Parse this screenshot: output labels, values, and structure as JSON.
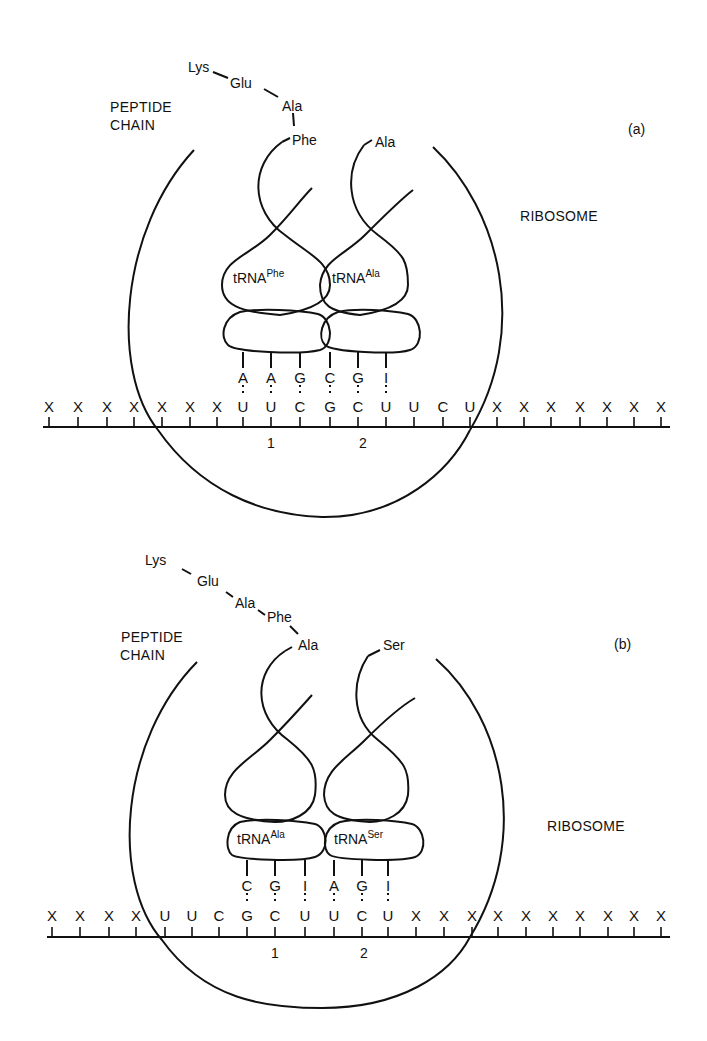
{
  "panels": [
    {
      "id": "a",
      "panel_label": "(a)",
      "peptide_label_line1": "PEPTIDE",
      "peptide_label_line2": "CHAIN",
      "ribosome_label": "RIBOSOME",
      "peptide_chain": [
        "Lys",
        "Glu",
        "Ala",
        "Phe"
      ],
      "trna_left": {
        "name": "tRNA",
        "sup": "Phe",
        "amino_acid": "Phe",
        "anticodon": [
          "A",
          "A",
          "G"
        ]
      },
      "trna_right": {
        "name": "tRNA",
        "sup": "Ala",
        "amino_acid": "Ala",
        "anticodon": [
          "C",
          "G",
          "I"
        ]
      },
      "mrna": [
        "X",
        "X",
        "X",
        "X",
        "X",
        "X",
        "X",
        "U",
        "U",
        "C",
        "G",
        "C",
        "U",
        "U",
        "C",
        "U",
        "X",
        "X",
        "X",
        "X",
        "X",
        "X",
        "X"
      ],
      "site_labels": [
        "1",
        "2"
      ]
    },
    {
      "id": "b",
      "panel_label": "(b)",
      "peptide_label_line1": "PEPTIDE",
      "peptide_label_line2": "CHAIN",
      "ribosome_label": "RIBOSOME",
      "peptide_chain": [
        "Lys",
        "Glu",
        "Ala",
        "Phe",
        "Ala"
      ],
      "trna_left": {
        "name": "tRNA",
        "sup": "Ala",
        "amino_acid": "Ala",
        "anticodon": [
          "C",
          "G",
          "I"
        ]
      },
      "trna_right": {
        "name": "tRNA",
        "sup": "Ser",
        "amino_acid": "Ser",
        "anticodon": [
          "A",
          "G",
          "I"
        ]
      },
      "mrna": [
        "X",
        "X",
        "X",
        "X",
        "U",
        "U",
        "C",
        "G",
        "C",
        "U",
        "U",
        "C",
        "U",
        "X",
        "X",
        "X",
        "X",
        "X",
        "X",
        "X",
        "X",
        "X",
        "X"
      ],
      "site_labels": [
        "1",
        "2"
      ]
    }
  ]
}
